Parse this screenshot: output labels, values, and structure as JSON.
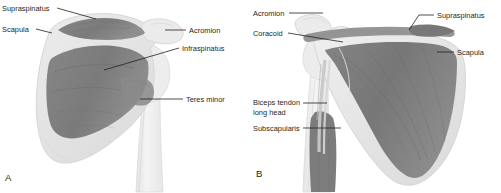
{
  "figure": {
    "width": 501,
    "height": 193,
    "background": "#ffffff"
  },
  "colors": {
    "muscle_dark": "#7c7c7c",
    "muscle_mid": "#8d8d8d",
    "muscle_shadow": "#6a6a6a",
    "bone_light": "#e9e9e9",
    "bone_outline": "#d2d2d2",
    "humerus": "#f1f1f1",
    "text": "#231f20",
    "leader": "#231f20"
  },
  "panels": [
    {
      "id": "a",
      "letter": "A",
      "view": "posterior",
      "labels": [
        {
          "id": "supraspinatus",
          "text": "Supraspinatus",
          "side": "left",
          "x": 2,
          "y": 4
        },
        {
          "id": "scapula",
          "text": "Scapula",
          "side": "left",
          "x": 2,
          "y": 26
        },
        {
          "id": "acromion",
          "text": "Acromion",
          "side": "right",
          "x": 189,
          "y": 27
        },
        {
          "id": "infraspinatus",
          "text": "Infraspinatus",
          "side": "right",
          "x": 182,
          "y": 45
        },
        {
          "id": "teres-minor",
          "text": "Teres minor",
          "side": "right",
          "x": 186,
          "y": 96
        }
      ]
    },
    {
      "id": "b",
      "letter": "B",
      "view": "anterior",
      "labels": [
        {
          "id": "acromion",
          "text": "Acromion",
          "side": "left",
          "x": 2,
          "y": 9
        },
        {
          "id": "coracoid",
          "text": "Coracoid",
          "side": "left",
          "x": 2,
          "y": 29
        },
        {
          "id": "supraspinatus",
          "text": "Supraspinatus",
          "side": "right",
          "x": 186,
          "y": 11
        },
        {
          "id": "scapula",
          "text": "Scapula",
          "side": "right",
          "x": 206,
          "y": 48
        },
        {
          "id": "biceps-tendon",
          "text": "Biceps tendon",
          "side": "left",
          "x": 2,
          "y": 99
        },
        {
          "id": "biceps-tendon-line2",
          "text": "long head",
          "side": "left",
          "x": 2,
          "y": 108
        },
        {
          "id": "subscapularis",
          "text": "Subscapularis",
          "side": "left",
          "x": 2,
          "y": 125
        }
      ]
    }
  ]
}
